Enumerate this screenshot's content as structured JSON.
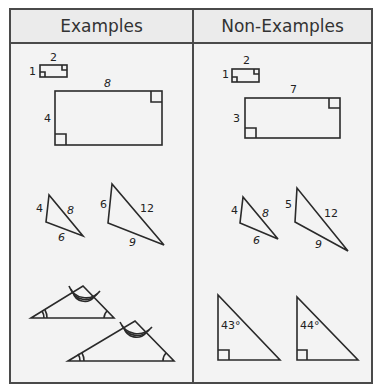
{
  "table": {
    "headers": {
      "left": "Examples",
      "right": "Non-Examples"
    }
  },
  "examples": {
    "rect_small": {
      "top": "2",
      "side": "1"
    },
    "rect_large": {
      "top": "8",
      "side": "4"
    },
    "tri_small": {
      "a": "4",
      "b": "8",
      "c": "6"
    },
    "tri_large": {
      "a": "6",
      "b": "12",
      "c": "9"
    }
  },
  "non_examples": {
    "rect_small": {
      "top": "2",
      "side": "1"
    },
    "rect_large": {
      "top": "7",
      "side": "3"
    },
    "tri_small": {
      "a": "4",
      "b": "8",
      "c": "6"
    },
    "tri_large": {
      "a": "5",
      "b": "12",
      "c": "9"
    },
    "right_tri_1": {
      "angle": "43°"
    },
    "right_tri_2": {
      "angle": "44°"
    }
  },
  "colors": {
    "line": "#2a2a2a",
    "border": "#4a4a4a",
    "background": "#f3f3f3"
  }
}
